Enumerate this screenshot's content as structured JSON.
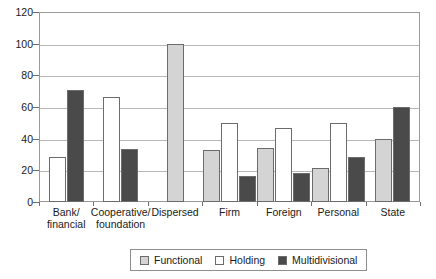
{
  "chart_data": {
    "type": "bar",
    "title": "",
    "subtitle": "",
    "xlabel": "",
    "ylabel": "",
    "ylim": [
      0,
      120
    ],
    "ytick_step": 20,
    "yticks": [
      0,
      20,
      40,
      60,
      80,
      100,
      120
    ],
    "grid": true,
    "grid_axis": "y",
    "legend_position": "bottom-center",
    "categories": [
      "Bank/ financial",
      "Cooperative/ foundation",
      "Dispersed",
      "Firm",
      "Foreign",
      "Personal",
      "State"
    ],
    "category_lines": [
      [
        "Bank/",
        "financial"
      ],
      [
        "Cooperative/",
        "foundation"
      ],
      [
        "Dispersed",
        ""
      ],
      [
        "Firm",
        ""
      ],
      [
        "Foreign",
        ""
      ],
      [
        "Personal",
        ""
      ],
      [
        "State",
        ""
      ]
    ],
    "series": [
      {
        "name": "Functional",
        "color": "#d4d4d4",
        "values": [
          null,
          null,
          100,
          33,
          34,
          21.5,
          40
        ]
      },
      {
        "name": "Holding",
        "color": "#ffffff",
        "values": [
          28.5,
          66.5,
          null,
          50,
          47,
          50,
          null
        ]
      },
      {
        "name": "Multidivisional",
        "color": "#4a4a4a",
        "values": [
          71,
          33.5,
          null,
          16.5,
          18.5,
          28.5,
          60
        ]
      }
    ]
  },
  "legend": {
    "items": [
      {
        "label": "Functional",
        "color": "#d4d4d4"
      },
      {
        "label": "Holding",
        "color": "#ffffff"
      },
      {
        "label": "Multidivisional",
        "color": "#4a4a4a"
      }
    ]
  },
  "axis": {
    "y_tick_labels": [
      "0",
      "20",
      "40",
      "60",
      "80",
      "100",
      "120"
    ]
  }
}
